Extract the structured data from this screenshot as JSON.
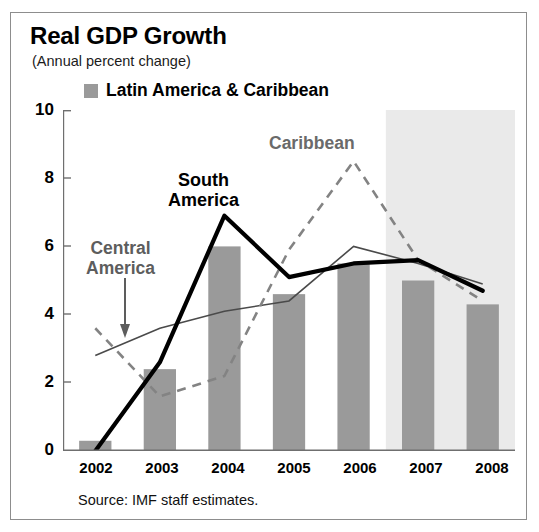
{
  "title": "Real GDP Growth",
  "subtitle": "(Annual percent change)",
  "legend": {
    "swatch_name": "bar-swatch",
    "label": "Latin America & Caribbean",
    "color": "#9a9a9a"
  },
  "source": "Source: IMF staff estimates.",
  "annotations": {
    "south_america": "South\nAmerica",
    "south_america_line1": "South",
    "south_america_line2": "America",
    "central_america_line1": "Central",
    "central_america_line2": "America",
    "caribbean": "Caribbean"
  },
  "axis": {
    "y_ticks": [
      "10",
      "8",
      "6",
      "4",
      "2",
      "0"
    ],
    "x_ticks": [
      "2002",
      "2003",
      "2004",
      "2005",
      "2006",
      "2007",
      "2008"
    ]
  },
  "chart_data": {
    "type": "bar",
    "title": "Real GDP Growth",
    "subtitle": "(Annual percent change)",
    "xlabel": "",
    "ylabel": "",
    "ylim": [
      0,
      10
    ],
    "ytick_values": [
      0,
      2,
      4,
      6,
      8,
      10
    ],
    "grid": false,
    "legend_position": "top-left",
    "categories": [
      "2002",
      "2003",
      "2004",
      "2005",
      "2006",
      "2007",
      "2008"
    ],
    "bars": {
      "name": "Latin America & Caribbean",
      "color": "#9a9a9a",
      "values": [
        0.3,
        2.4,
        6.0,
        4.6,
        5.5,
        5.0,
        4.3
      ]
    },
    "series": [
      {
        "name": "South America",
        "style": "solid-thick",
        "color": "#000000",
        "values": [
          -0.5,
          2.6,
          6.9,
          5.1,
          5.5,
          5.6,
          4.7
        ]
      },
      {
        "name": "Central America",
        "style": "solid-thin",
        "color": "#4a4a4a",
        "values": [
          2.8,
          3.6,
          4.1,
          4.4,
          6.0,
          5.5,
          4.9
        ]
      },
      {
        "name": "Caribbean",
        "style": "dashed",
        "color": "#808080",
        "values": [
          3.6,
          1.6,
          2.2,
          5.9,
          8.5,
          5.6,
          4.4
        ]
      }
    ],
    "shaded_forecast_region": {
      "label": "projection",
      "from_x": "2006.5",
      "to_x": "2008.5",
      "color": "#eaeaea"
    },
    "annotations": [
      {
        "text": "South America",
        "near": "2004"
      },
      {
        "text": "Central America",
        "near": "2002-2003",
        "has_arrow": true
      },
      {
        "text": "Caribbean",
        "near": "2006"
      }
    ]
  }
}
